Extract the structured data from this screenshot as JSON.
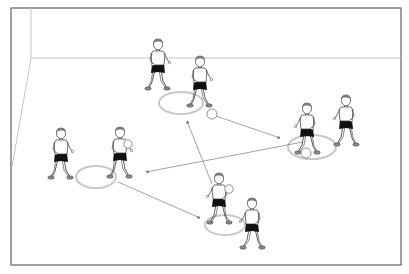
{
  "diagram": {
    "title": "Passing drill: four hoop stations with players passing balls between circles",
    "frame": {
      "x": 11,
      "y": 8,
      "w": 390,
      "h": 257
    },
    "colors": {
      "frame": "#6e6e6e",
      "wall_line": "#bdbdbd",
      "hoop": "#c8c8c8",
      "arrow": "#8a8a8a",
      "hair": "#7a7a7a",
      "shorts": "#111111",
      "shoes": "#8a8a8a",
      "skin_outline": "#333333"
    },
    "stations": [
      {
        "id": "top",
        "hoop": {
          "cx": 181,
          "cy": 103,
          "rx": 22,
          "ry": 11
        }
      },
      {
        "id": "right",
        "hoop": {
          "cx": 312,
          "cy": 147,
          "rx": 24,
          "ry": 12
        }
      },
      {
        "id": "left",
        "hoop": {
          "cx": 96,
          "cy": 177,
          "rx": 20,
          "ry": 11
        }
      },
      {
        "id": "bottom",
        "hoop": {
          "cx": 225,
          "cy": 225,
          "rx": 20,
          "ry": 10
        }
      }
    ],
    "players": [
      {
        "id": "p1",
        "label": "waiting player top",
        "x": 158,
        "y": 40,
        "scale": 1.0,
        "facing": "right",
        "ball": false
      },
      {
        "id": "p2",
        "label": "dribbling player top",
        "x": 200,
        "y": 58,
        "scale": 1.0,
        "facing": "right",
        "ball": false
      },
      {
        "id": "p3",
        "label": "dribbling player right",
        "x": 306,
        "y": 105,
        "scale": 1.0,
        "facing": "left",
        "ball": true
      },
      {
        "id": "p4",
        "label": "waiting player right",
        "x": 346,
        "y": 96,
        "scale": 1.0,
        "facing": "left",
        "ball": false
      },
      {
        "id": "p5",
        "label": "waiting player left",
        "x": 61,
        "y": 130,
        "scale": 1.0,
        "facing": "right",
        "ball": false
      },
      {
        "id": "p6",
        "label": "dribbling player left",
        "x": 120,
        "y": 128,
        "scale": 1.0,
        "facing": "right",
        "ball": true
      },
      {
        "id": "p7",
        "label": "dribbling player bottom",
        "x": 219,
        "y": 175,
        "scale": 1.0,
        "facing": "left",
        "ball": true
      },
      {
        "id": "p8",
        "label": "waiting player bottom",
        "x": 252,
        "y": 200,
        "scale": 1.0,
        "facing": "left",
        "ball": false
      }
    ],
    "balls": [
      {
        "id": "b1",
        "cx": 212,
        "cy": 114,
        "r": 5
      },
      {
        "id": "b2",
        "cx": 306,
        "cy": 153,
        "r": 5
      }
    ],
    "arrows": [
      {
        "id": "a1",
        "from": [
          216,
          116
        ],
        "to": [
          280,
          138
        ],
        "label": "pass from top hoop to right hoop"
      },
      {
        "id": "a2",
        "from": [
          303,
          142
        ],
        "to": [
          146,
          172
        ],
        "label": "pass from right hoop to left hoop"
      },
      {
        "id": "a3",
        "from": [
          118,
          182
        ],
        "to": [
          200,
          218
        ],
        "label": "pass from left hoop to bottom hoop"
      },
      {
        "id": "a4",
        "from": [
          212,
          184
        ],
        "to": [
          187,
          121
        ],
        "label": "pass from bottom hoop to top hoop"
      }
    ]
  }
}
